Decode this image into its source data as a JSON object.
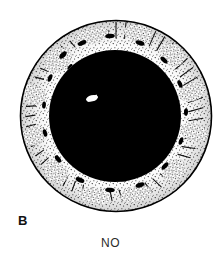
{
  "figure": {
    "panel_label": "B",
    "caption": "NO",
    "illustration_style": "black-and-white-stipple-line-art",
    "colors": {
      "background": "#ffffff",
      "ink": "#000000",
      "pupil_fill": "#000000",
      "iris_fill": "#ffffff",
      "highlight": "#ffffff",
      "label_text": "#111111",
      "caption_text": "#2b2b2b"
    },
    "geometry": {
      "outer_circle": {
        "cx": 116,
        "cy": 116,
        "r": 96
      },
      "iris_inner_edge": {
        "cx": 115,
        "cy": 116,
        "r": 66
      },
      "pupil": {
        "cx": 115,
        "cy": 116,
        "r": 66
      },
      "corneal_reflex": {
        "cx": 92,
        "cy": 98,
        "rx": 6,
        "ry": 3,
        "rotation_deg": -12
      }
    },
    "parts": [
      {
        "name": "limbus-outline",
        "description": "outer circular outline of the iris/limbus"
      },
      {
        "name": "iris-ring",
        "description": "stippled and hatched iris tissue ring"
      },
      {
        "name": "pupil",
        "description": "large solid black dilated pupil"
      },
      {
        "name": "corneal-light-reflex",
        "description": "small white slanted highlight inside pupil"
      }
    ]
  }
}
